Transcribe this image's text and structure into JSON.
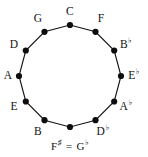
{
  "diagram": {
    "type": "circle-of-fifths",
    "background_color": "#ffffff",
    "line_color": "#151515",
    "node_color": "#0d0d0d",
    "text_color": "#111111",
    "center": {
      "x": 70,
      "y": 76
    },
    "radius": 51,
    "node_radius": 3.1,
    "node_count": 12,
    "nodes": [
      {
        "id": "C",
        "label": "C",
        "accidental": "",
        "angle_deg": 0,
        "node": {
          "x": 70,
          "y": 25
        },
        "label_pos": {
          "x": 70,
          "y": 12
        }
      },
      {
        "id": "F",
        "label": "F",
        "accidental": "",
        "angle_deg": 30,
        "node": {
          "x": 95.5,
          "y": 31.8
        },
        "label_pos": {
          "x": 101,
          "y": 19
        }
      },
      {
        "id": "Bb",
        "label": "B",
        "accidental": "♭",
        "angle_deg": 60,
        "node": {
          "x": 114.2,
          "y": 50.5
        },
        "label_pos": {
          "x": 126,
          "y": 45
        }
      },
      {
        "id": "Eb",
        "label": "E",
        "accidental": "♭",
        "angle_deg": 90,
        "node": {
          "x": 121,
          "y": 76
        },
        "label_pos": {
          "x": 134,
          "y": 76
        }
      },
      {
        "id": "Ab",
        "label": "A",
        "accidental": "♭",
        "angle_deg": 120,
        "node": {
          "x": 114.2,
          "y": 101.5
        },
        "label_pos": {
          "x": 126,
          "y": 107
        }
      },
      {
        "id": "Db",
        "label": "D",
        "accidental": "♭",
        "angle_deg": 150,
        "node": {
          "x": 95.5,
          "y": 120.2
        },
        "label_pos": {
          "x": 103,
          "y": 132
        }
      },
      {
        "id": "Fsharp-Gb",
        "label": "F",
        "accidental": "♯",
        "label2": "G",
        "accidental2": "♭",
        "equals": "=",
        "angle_deg": 180,
        "node": {
          "x": 70,
          "y": 127
        },
        "label_pos": {
          "x": 70,
          "y": 146
        }
      },
      {
        "id": "B",
        "label": "B",
        "accidental": "",
        "angle_deg": 210,
        "node": {
          "x": 44.5,
          "y": 120.2
        },
        "label_pos": {
          "x": 38,
          "y": 132
        }
      },
      {
        "id": "E",
        "label": "E",
        "accidental": "",
        "angle_deg": 240,
        "node": {
          "x": 25.8,
          "y": 101.5
        },
        "label_pos": {
          "x": 14,
          "y": 107
        }
      },
      {
        "id": "A",
        "label": "A",
        "accidental": "",
        "angle_deg": 270,
        "node": {
          "x": 19,
          "y": 76
        },
        "label_pos": {
          "x": 8,
          "y": 76
        }
      },
      {
        "id": "D",
        "label": "D",
        "accidental": "",
        "angle_deg": 300,
        "node": {
          "x": 25.8,
          "y": 50.5
        },
        "label_pos": {
          "x": 14,
          "y": 45
        }
      },
      {
        "id": "G",
        "label": "G",
        "accidental": "",
        "angle_deg": 330,
        "node": {
          "x": 44.5,
          "y": 31.8
        },
        "label_pos": {
          "x": 38,
          "y": 19
        }
      }
    ]
  }
}
